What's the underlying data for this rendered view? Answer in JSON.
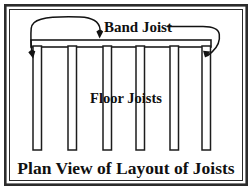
{
  "figure": {
    "caption": "Plan View of Layout of Joists",
    "background_color": "#ffffff",
    "ink_color": "#1a1a1a"
  },
  "labels": {
    "band_joist": "Band Joist",
    "floor_joists": "Floor Joists"
  },
  "icons": {
    "arrow_band": "arrow-down-icon",
    "arrow_left_joist": "arrow-down-icon",
    "arrow_right_joist": "arrow-left-icon"
  },
  "diagram_data": {
    "type": "diagram",
    "subject": "floor framing plan view",
    "frame": {
      "x": 4,
      "y": 4,
      "width": 244,
      "height": 182
    },
    "band_joist": {
      "x": 31,
      "y": 40,
      "width": 180,
      "height": 7
    },
    "floor_joist_count": 6,
    "floor_joists": [
      {
        "x": 33,
        "y": 47,
        "width": 8,
        "height": 103
      },
      {
        "x": 68,
        "y": 47,
        "width": 8,
        "height": 103
      },
      {
        "x": 103,
        "y": 47,
        "width": 8,
        "height": 103
      },
      {
        "x": 136,
        "y": 47,
        "width": 8,
        "height": 103
      },
      {
        "x": 170,
        "y": 47,
        "width": 8,
        "height": 103
      },
      {
        "x": 202,
        "y": 47,
        "width": 8,
        "height": 103
      }
    ],
    "leaders": [
      {
        "name": "band-joist-left-leader",
        "target": "band joist beam and left rim joist"
      },
      {
        "name": "band-joist-right-leader",
        "target": "right rim joist"
      }
    ]
  }
}
